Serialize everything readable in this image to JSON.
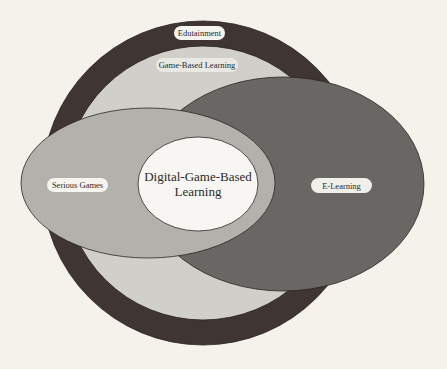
{
  "diagram": {
    "type": "nested-venn",
    "title": "",
    "colors": {
      "background": "#f4f2eb",
      "edutainment": "#3f3633",
      "game_based_learning": "#d1cfca",
      "serious_games": "#b3b1ac",
      "e_learning": "#696764",
      "digital_game_based_learning": "#f7f6f2",
      "label_pill": "#f5f4ef",
      "outline": "#2b2522"
    },
    "sets": [
      {
        "id": "edutainment",
        "label": "Edutainment"
      },
      {
        "id": "game_based_learning",
        "label": "Game-Based Learning"
      },
      {
        "id": "serious_games",
        "label": "Serious Games"
      },
      {
        "id": "e_learning",
        "label": "E-Learning"
      },
      {
        "id": "digital_game_based_learning",
        "label_line1": "Digital-Game-Based",
        "label_line2": "Learning"
      }
    ]
  }
}
